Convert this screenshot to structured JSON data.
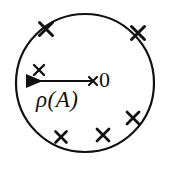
{
  "figure": {
    "type": "geometric-diagram",
    "canvas": {
      "width": 171,
      "height": 174,
      "background": "#ffffff"
    },
    "stroke_color": "#111111",
    "circle": {
      "cx": 85,
      "cy": 83,
      "r": 69,
      "stroke_width": 2.2
    },
    "arrow": {
      "name": "radius-arrow",
      "from_x": 93,
      "from_y": 81,
      "to_x": 18,
      "to_y": 81,
      "stroke_width": 2,
      "head_length": 14,
      "head_width": 9,
      "direction": "left"
    },
    "labels": [
      {
        "id": "rho",
        "text": "ρ(A)",
        "x": 36,
        "y": 88,
        "style": "italic-serif"
      },
      {
        "id": "origin",
        "text": "0",
        "x": 99,
        "y": 69,
        "style": "upright-serif"
      }
    ],
    "cross_marks": [
      {
        "id": "cross-arc-top-left",
        "x": 46,
        "y": 29,
        "size": 13,
        "stroke_width": 3.0,
        "location": "on-circle"
      },
      {
        "id": "cross-arc-top-right",
        "x": 138,
        "y": 33,
        "size": 13,
        "stroke_width": 3.0,
        "location": "on-circle"
      },
      {
        "id": "cross-inner-left",
        "x": 39,
        "y": 70,
        "size": 10,
        "stroke_width": 2.4,
        "location": "inside"
      },
      {
        "id": "cross-origin",
        "x": 93,
        "y": 81,
        "size": 8,
        "stroke_width": 2.2,
        "location": "centre"
      },
      {
        "id": "cross-lower-right",
        "x": 133,
        "y": 118,
        "size": 12,
        "stroke_width": 2.8,
        "location": "inside"
      },
      {
        "id": "cross-bottom-left",
        "x": 61,
        "y": 137,
        "size": 11,
        "stroke_width": 2.6,
        "location": "inside"
      },
      {
        "id": "cross-bottom-centre",
        "x": 103,
        "y": 135,
        "size": 12,
        "stroke_width": 2.8,
        "location": "inside"
      }
    ]
  }
}
